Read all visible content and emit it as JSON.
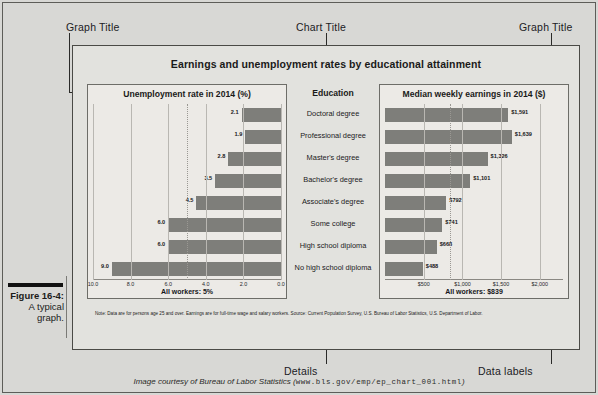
{
  "figure": {
    "number": "Figure 16-4:",
    "caption_lines": [
      "A typical",
      "graph."
    ]
  },
  "annotations": {
    "graph_title_left": "Graph Title",
    "chart_title": "Chart Title",
    "graph_title_right": "Graph Title",
    "details": "Details",
    "data_labels": "Data labels"
  },
  "source_line": {
    "prefix": "Image courtesy of Bureau of Labor Statistics (",
    "url": "www.bls.gov/emp/ep_chart_001.html",
    "suffix": ")"
  },
  "graphic": {
    "title": "Earnings and unemployment rates by educational attainment",
    "education_column_title": "Education",
    "note": "Note: Data are for persons age 25 and over. Earnings are for full-time wage and salary workers. Source: Current Population Survey, U.S. Bureau of Labor Statistics, U.S. Department of Labor.",
    "bar_color": "#7e7e7a",
    "panel_bg": "#eceae6",
    "graphic_bg": "#e2e2de"
  },
  "chart_data": [
    {
      "type": "bar",
      "title": "Unemployment rate in 2014 (%)",
      "orientation": "horizontal",
      "direction": "right-to-left",
      "xlabel": "",
      "ylabel": "",
      "xlim": [
        0,
        10
      ],
      "axis_reversed": true,
      "grid": true,
      "tick_labels": [
        "10.0",
        "8.0",
        "6.0",
        "4.0",
        "2.0",
        "0.0"
      ],
      "tick_values": [
        10.0,
        8.0,
        6.0,
        4.0,
        2.0,
        0.0
      ],
      "reference_line": {
        "value": 5.0,
        "label": "All workers: 5%",
        "style": "dotted"
      },
      "categories": [
        "Doctoral degree",
        "Professional degree",
        "Master's degree",
        "Bachelor's degree",
        "Associate's degree",
        "Some college",
        "High school diploma",
        "No high school diploma"
      ],
      "values": [
        2.1,
        1.9,
        2.8,
        3.5,
        4.5,
        6.0,
        6.0,
        9.0
      ],
      "data_labels": [
        "2.1",
        "1.9",
        "2.8",
        "3.5",
        "4.5",
        "6.0",
        "6.0",
        "9.0"
      ],
      "footer": "All workers: 5%"
    },
    {
      "type": "bar",
      "title": "Median weekly earnings in 2014 ($)",
      "orientation": "horizontal",
      "direction": "left-to-right",
      "xlabel": "",
      "ylabel": "",
      "xlim": [
        0,
        2300
      ],
      "axis_reversed": false,
      "grid": true,
      "tick_labels": [
        "$500",
        "$1,000",
        "$1,500",
        "$2,000"
      ],
      "tick_values": [
        500,
        1000,
        1500,
        2000
      ],
      "reference_line": {
        "value": 839,
        "label": "All workers: $839",
        "style": "dotted"
      },
      "categories": [
        "Doctoral degree",
        "Professional degree",
        "Master's degree",
        "Bachelor's degree",
        "Associate's degree",
        "Some college",
        "High school diploma",
        "No high school diploma"
      ],
      "values": [
        1591,
        1639,
        1326,
        1101,
        792,
        741,
        668,
        488
      ],
      "data_labels": [
        "$1,591",
        "$1,639",
        "$1,326",
        "$1,101",
        "$792",
        "$741",
        "$668",
        "$488"
      ],
      "footer": "All workers: $839"
    }
  ]
}
